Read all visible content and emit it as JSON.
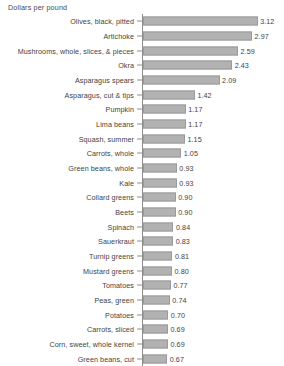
{
  "chart_data": {
    "type": "bar",
    "orientation": "horizontal",
    "title": "",
    "xlabel": "Dollars per pound",
    "ylabel": "",
    "grid": false,
    "legend": null,
    "xlim": [
      0,
      3.12
    ],
    "bar_color": "#b2b2b2",
    "bar_border_color": "#9a9a9a",
    "axis_color": "#8d8d8d",
    "text_color": "#3f3f3f",
    "categories": [
      "Olives, black, pitted",
      "Artichoke",
      "Mushrooms, whole, slices, & pieces",
      "Okra",
      "Asparagus spears",
      "Asparagus, cut & tips",
      "Pumpkin",
      "Lima beans",
      "Squash, summer",
      "Carrots, whole",
      "Green beans, whole",
      "Kale",
      "Collard greens",
      "Beets",
      "Spinach",
      "Sauerkraut",
      "Turnip greens",
      "Mustard greens",
      "Tomatoes",
      "Peas, green",
      "Potatoes",
      "Carrots, sliced",
      "Corn, sweet, whole kernel",
      "Green beans, cut"
    ],
    "values": [
      3.12,
      2.97,
      2.59,
      2.43,
      2.09,
      1.42,
      1.17,
      1.17,
      1.15,
      1.05,
      0.93,
      0.93,
      0.9,
      0.9,
      0.84,
      0.83,
      0.81,
      0.8,
      0.77,
      0.74,
      0.7,
      0.69,
      0.69,
      0.67
    ],
    "value_labels": [
      "3.12",
      "2.97",
      "2.59",
      "2.43",
      "2.09",
      "1.42",
      "1.17",
      "1.17",
      "1.15",
      "1.05",
      "0.93",
      "0.93",
      "0.90",
      "0.90",
      "0.84",
      "0.83",
      "0.81",
      "0.80",
      "0.77",
      "0.74",
      "0.70",
      "0.69",
      "0.69",
      "0.67"
    ]
  }
}
